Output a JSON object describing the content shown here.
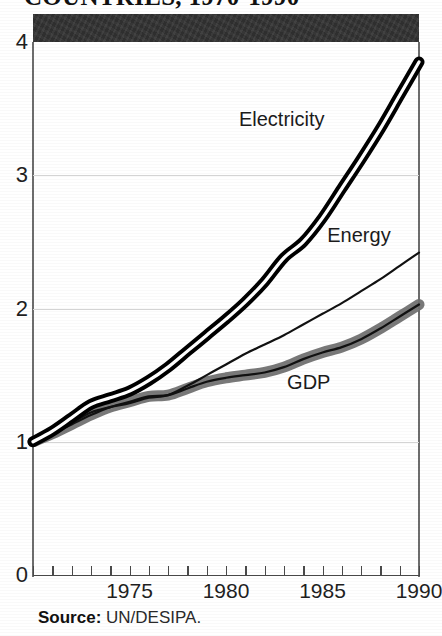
{
  "figure": {
    "title_cropped": "COUNTRIES, 1970-1990",
    "source_label": "Source:",
    "source_value": " UN/DESIPA."
  },
  "chart_data": {
    "type": "line",
    "title": "COUNTRIES, 1970-1990",
    "xlabel": "",
    "ylabel": "",
    "xlim": [
      1970,
      1990
    ],
    "ylim": [
      0,
      4
    ],
    "yticks": [
      0,
      1,
      2,
      3,
      4
    ],
    "xticks": [
      1970,
      1971,
      1972,
      1973,
      1974,
      1975,
      1976,
      1977,
      1978,
      1979,
      1980,
      1981,
      1982,
      1983,
      1984,
      1985,
      1986,
      1987,
      1988,
      1989,
      1990
    ],
    "xtick_labels_shown": [
      "1975",
      "1980",
      "1985",
      "1990"
    ],
    "grid": "horizontal gridlines at 1, 2, 3",
    "legend": "inline labels on curves",
    "x": [
      1970,
      1971,
      1972,
      1973,
      1974,
      1975,
      1976,
      1977,
      1978,
      1979,
      1980,
      1981,
      1982,
      1983,
      1984,
      1985,
      1986,
      1987,
      1988,
      1989,
      1990
    ],
    "series": [
      {
        "name": "Electricity",
        "style": "double-black-line",
        "values": [
          1.0,
          1.08,
          1.18,
          1.28,
          1.33,
          1.38,
          1.46,
          1.56,
          1.68,
          1.8,
          1.92,
          2.05,
          2.2,
          2.38,
          2.5,
          2.68,
          2.9,
          3.12,
          3.35,
          3.6,
          3.85
        ]
      },
      {
        "name": "Energy",
        "style": "thin-black-line",
        "values": [
          1.0,
          1.06,
          1.14,
          1.22,
          1.26,
          1.29,
          1.33,
          1.35,
          1.42,
          1.5,
          1.58,
          1.66,
          1.73,
          1.8,
          1.88,
          1.96,
          2.04,
          2.13,
          2.22,
          2.32,
          2.42
        ]
      },
      {
        "name": "GDP",
        "style": "gray-band-with-centerline",
        "values": [
          1.0,
          1.06,
          1.13,
          1.2,
          1.26,
          1.3,
          1.34,
          1.35,
          1.4,
          1.45,
          1.48,
          1.5,
          1.52,
          1.56,
          1.62,
          1.67,
          1.71,
          1.77,
          1.85,
          1.94,
          2.03
        ]
      }
    ],
    "annotations": [
      {
        "text": "Electricity",
        "x": 1983.2,
        "y": 3.42
      },
      {
        "text": "Energy",
        "x": 1987.2,
        "y": 2.55
      },
      {
        "text": "GDP",
        "x": 1984.6,
        "y": 1.45
      }
    ]
  },
  "colors": {
    "header_band": "#2f2f2f",
    "electricity": "#000000",
    "energy": "#111111",
    "gdp_band": "#6e6e6e",
    "gdp_line": "#111111",
    "gridline": "#d4d4d4",
    "axis": "#4a4a4a"
  }
}
